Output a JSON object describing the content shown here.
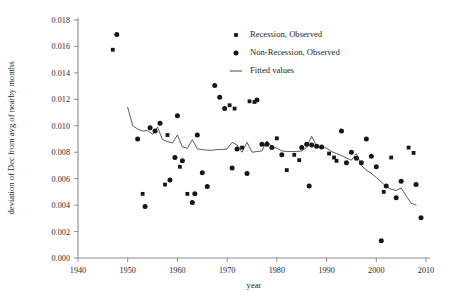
{
  "chart_data": {
    "type": "scatter",
    "title": "",
    "xlabel": "year",
    "ylabel": "deviation of Dec from avg of nearby months",
    "xlim": [
      1940,
      2010
    ],
    "ylim": [
      0.0,
      0.018
    ],
    "xticks": [
      1940,
      1950,
      1960,
      1970,
      1980,
      1990,
      2000,
      2010
    ],
    "xtick_labels": [
      "1940",
      "1950",
      "1960",
      "1970",
      "1980",
      "1990",
      "2000",
      "2010"
    ],
    "yticks": [
      0.0,
      0.002,
      0.004,
      0.006,
      0.008,
      0.01,
      0.012,
      0.014,
      0.016,
      0.018
    ],
    "ytick_labels": [
      "0.000",
      "0.002",
      "0.004",
      "0.006",
      "0.008",
      "0.010",
      "0.012",
      "0.014",
      "0.016",
      "0.018"
    ],
    "grid": false,
    "legend_position": "top-right",
    "legend": [
      {
        "label": "Recession, Observed",
        "marker": "square",
        "color": "#17161a"
      },
      {
        "label": "Non-Recession, Observed",
        "marker": "circle",
        "color": "#17161a"
      },
      {
        "label": "Fitted values",
        "marker": "line",
        "color": "#4a4748"
      }
    ],
    "series": [
      {
        "name": "Recession, Observed",
        "marker": "square",
        "points": [
          [
            1947.0,
            0.01575
          ],
          [
            1953.0,
            0.00485
          ],
          [
            1957.5,
            0.00555
          ],
          [
            1958.0,
            0.0093
          ],
          [
            1960.5,
            0.0069
          ],
          [
            1962.0,
            0.00485
          ],
          [
            1970.5,
            0.01155
          ],
          [
            1971.5,
            0.0113
          ],
          [
            1973.0,
            0.00835
          ],
          [
            1974.5,
            0.01185
          ],
          [
            1975.5,
            0.0118
          ],
          [
            1980.0,
            0.00905
          ],
          [
            1982.0,
            0.00665
          ],
          [
            1983.5,
            0.0078
          ],
          [
            1984.5,
            0.0074
          ],
          [
            1990.5,
            0.0079
          ],
          [
            1991.5,
            0.0076
          ],
          [
            1992.0,
            0.00735
          ],
          [
            2001.5,
            0.005
          ],
          [
            2003.0,
            0.0076
          ],
          [
            2006.5,
            0.00835
          ],
          [
            2007.5,
            0.00795
          ]
        ]
      },
      {
        "name": "Non-Recession, Observed",
        "marker": "circle",
        "points": [
          [
            1947.8,
            0.0169
          ],
          [
            1952.0,
            0.009
          ],
          [
            1953.5,
            0.0039
          ],
          [
            1954.5,
            0.00985
          ],
          [
            1955.5,
            0.0096
          ],
          [
            1956.5,
            0.0102
          ],
          [
            1958.5,
            0.0059
          ],
          [
            1959.5,
            0.0076
          ],
          [
            1960.0,
            0.01075
          ],
          [
            1961.0,
            0.00735
          ],
          [
            1963.0,
            0.0042
          ],
          [
            1963.5,
            0.00485
          ],
          [
            1964.0,
            0.0093
          ],
          [
            1965.0,
            0.00645
          ],
          [
            1966.0,
            0.0054
          ],
          [
            1967.5,
            0.01305
          ],
          [
            1968.5,
            0.01215
          ],
          [
            1969.5,
            0.0113
          ],
          [
            1971.0,
            0.0068
          ],
          [
            1972.0,
            0.00825
          ],
          [
            1976.0,
            0.01195
          ],
          [
            1977.0,
            0.0086
          ],
          [
            1978.0,
            0.0086
          ],
          [
            1979.0,
            0.00835
          ],
          [
            1981.0,
            0.0078
          ],
          [
            1985.0,
            0.00835
          ],
          [
            1986.0,
            0.0086
          ],
          [
            1987.0,
            0.00855
          ],
          [
            1988.0,
            0.00845
          ],
          [
            1989.0,
            0.0084
          ],
          [
            1993.0,
            0.0096
          ],
          [
            1994.0,
            0.0072
          ],
          [
            1995.0,
            0.008
          ],
          [
            1996.0,
            0.00755
          ],
          [
            1997.0,
            0.0072
          ],
          [
            1998.0,
            0.009
          ],
          [
            1999.0,
            0.0077
          ],
          [
            2000.0,
            0.0069
          ],
          [
            2001.0,
            0.0013
          ],
          [
            2002.0,
            0.00545
          ],
          [
            2004.0,
            0.00455
          ],
          [
            2005.0,
            0.0058
          ],
          [
            2008.0,
            0.00555
          ],
          [
            2009.0,
            0.00305
          ],
          [
            1974.0,
            0.0064
          ],
          [
            1986.5,
            0.00545
          ]
        ]
      }
    ],
    "fitted_values": {
      "name": "Fitted values",
      "points": [
        [
          1950.0,
          0.0114
        ],
        [
          1951.0,
          0.01
        ],
        [
          1952.0,
          0.00975
        ],
        [
          1953.0,
          0.0096
        ],
        [
          1954.0,
          0.00965
        ],
        [
          1955.0,
          0.00935
        ],
        [
          1956.0,
          0.0099
        ],
        [
          1957.0,
          0.00895
        ],
        [
          1958.0,
          0.0088
        ],
        [
          1959.0,
          0.0087
        ],
        [
          1960.0,
          0.0093
        ],
        [
          1961.0,
          0.0084
        ],
        [
          1962.0,
          0.0083
        ],
        [
          1963.0,
          0.00895
        ],
        [
          1964.0,
          0.00825
        ],
        [
          1965.0,
          0.0082
        ],
        [
          1966.0,
          0.00815
        ],
        [
          1967.0,
          0.00815
        ],
        [
          1968.0,
          0.0082
        ],
        [
          1969.0,
          0.0082
        ],
        [
          1970.0,
          0.00825
        ],
        [
          1971.0,
          0.00875
        ],
        [
          1972.0,
          0.00855
        ],
        [
          1973.0,
          0.008
        ],
        [
          1974.0,
          0.00875
        ],
        [
          1975.0,
          0.008
        ],
        [
          1976.0,
          0.00805
        ],
        [
          1977.0,
          0.0081
        ],
        [
          1978.0,
          0.00885
        ],
        [
          1979.0,
          0.0084
        ],
        [
          1980.0,
          0.0083
        ],
        [
          1981.0,
          0.0081
        ],
        [
          1982.0,
          0.00805
        ],
        [
          1983.0,
          0.00805
        ],
        [
          1984.0,
          0.00805
        ],
        [
          1985.0,
          0.0081
        ],
        [
          1986.0,
          0.00835
        ],
        [
          1987.0,
          0.0092
        ],
        [
          1988.0,
          0.00845
        ],
        [
          1989.0,
          0.0084
        ],
        [
          1990.0,
          0.0083
        ],
        [
          1991.0,
          0.00805
        ],
        [
          1992.0,
          0.0079
        ],
        [
          1993.0,
          0.00775
        ],
        [
          1994.0,
          0.00755
        ],
        [
          1995.0,
          0.0074
        ],
        [
          1996.0,
          0.0079
        ],
        [
          1997.0,
          0.007
        ],
        [
          1998.0,
          0.00665
        ],
        [
          1999.0,
          0.0064
        ],
        [
          2000.0,
          0.0061
        ],
        [
          2001.0,
          0.00575
        ],
        [
          2002.0,
          0.0054
        ],
        [
          2003.0,
          0.0052
        ],
        [
          2004.0,
          0.0051
        ],
        [
          2005.0,
          0.0053
        ],
        [
          2006.0,
          0.0047
        ],
        [
          2007.0,
          0.00415
        ],
        [
          2008.0,
          0.004
        ]
      ]
    }
  }
}
